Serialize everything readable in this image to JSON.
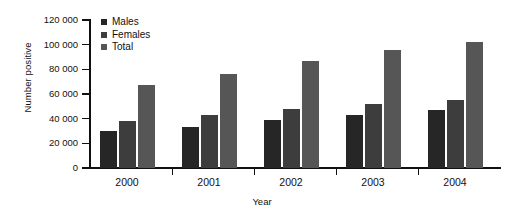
{
  "chart_data": {
    "type": "bar",
    "title": "",
    "subtitle": "",
    "xlabel": "Year",
    "ylabel": "Number positive",
    "categories": [
      "2000",
      "2001",
      "2002",
      "2003",
      "2004"
    ],
    "series": [
      {
        "name": "Males",
        "values": [
          30000,
          33000,
          39000,
          43000,
          47000
        ],
        "color": "#262626"
      },
      {
        "name": "Females",
        "values": [
          38000,
          43000,
          48000,
          52000,
          55000
        ],
        "color": "#3d3d3d"
      },
      {
        "name": "Total",
        "values": [
          67000,
          76000,
          87000,
          96000,
          102000
        ],
        "color": "#565656"
      }
    ],
    "ylim": [
      0,
      120000
    ],
    "ytick_values": [
      0,
      20000,
      40000,
      60000,
      80000,
      100000,
      120000
    ],
    "ytick_labels": [
      "0",
      "20 000",
      "40 000",
      "60 000",
      "80 000",
      "100 000",
      "120 000"
    ],
    "grid": false,
    "legend_position": "top-left-inside",
    "legend_entries": [
      "Males",
      "Females",
      "Total"
    ],
    "annotations": []
  },
  "axes": {
    "y_title": "Number positive",
    "x_title": "Year"
  }
}
